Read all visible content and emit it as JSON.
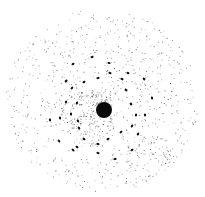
{
  "image": {
    "description": "Electron diffraction pattern: dark central beam with ring of elliptical diffraction spots over diffuse speckle background",
    "background": "#ffffff",
    "ink": "#111111",
    "center": {
      "x": 104,
      "y": 110,
      "r": 8
    },
    "spots": [
      [
        92,
        57
      ],
      [
        109,
        63
      ],
      [
        110,
        73
      ],
      [
        128,
        73
      ],
      [
        73,
        64
      ],
      [
        66,
        81
      ],
      [
        84,
        82
      ],
      [
        98,
        78
      ],
      [
        122,
        79
      ],
      [
        126,
        90
      ],
      [
        144,
        79
      ],
      [
        152,
        98
      ],
      [
        72,
        88
      ],
      [
        66,
        102
      ],
      [
        77,
        103
      ],
      [
        131,
        104
      ],
      [
        136,
        115
      ],
      [
        145,
        115
      ],
      [
        71,
        114
      ],
      [
        50,
        120
      ],
      [
        60,
        118
      ],
      [
        78,
        121
      ],
      [
        132,
        126
      ],
      [
        121,
        132
      ],
      [
        138,
        134
      ],
      [
        79,
        128
      ],
      [
        84,
        139
      ],
      [
        108,
        139
      ],
      [
        59,
        141
      ],
      [
        98,
        144
      ],
      [
        77,
        147
      ],
      [
        73,
        150
      ],
      [
        132,
        150
      ],
      [
        98,
        153
      ],
      [
        115,
        159
      ]
    ]
  }
}
